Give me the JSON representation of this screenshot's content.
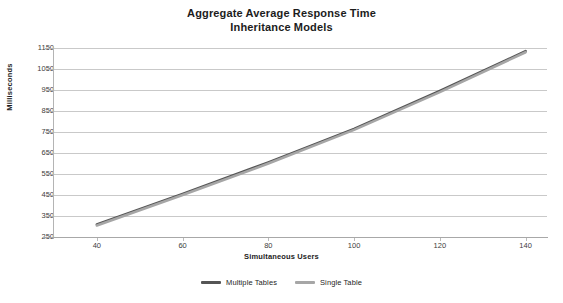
{
  "chart_data": {
    "type": "line",
    "title": "Aggregate Average Response Time",
    "subtitle": "Inheritance Models",
    "title_lines": [
      "Aggregate Average Response Time",
      "Inheritance Models"
    ],
    "xlabel": "Simultaneous Users",
    "ylabel": "Milliseconds",
    "x": [
      40,
      60,
      80,
      100,
      120,
      140
    ],
    "xlim": [
      30,
      145
    ],
    "ylim": [
      250,
      1150
    ],
    "xticks": [
      40,
      60,
      80,
      100,
      120,
      140
    ],
    "yticks": [
      250,
      350,
      450,
      550,
      650,
      750,
      850,
      950,
      1050,
      1150
    ],
    "grid": true,
    "grid_axis": "y",
    "legend_position": "bottom",
    "series": [
      {
        "name": "Multiple Tables",
        "color": "#555555",
        "values": [
          310,
          455,
          605,
          765,
          945,
          1135
        ]
      },
      {
        "name": "Single Table",
        "color": "#a6a6a6",
        "values": [
          305,
          450,
          600,
          760,
          940,
          1130
        ]
      }
    ]
  },
  "colors": {
    "grid": "#c9c9c9",
    "axis": "#b4b4b4",
    "text": "#1c1c1c",
    "tick_text": "#3d3d3d",
    "background": "#ffffff"
  },
  "legend": {
    "items": [
      {
        "label": "Multiple Tables",
        "color": "#555555"
      },
      {
        "label": "Single Table",
        "color": "#a6a6a6"
      }
    ]
  }
}
